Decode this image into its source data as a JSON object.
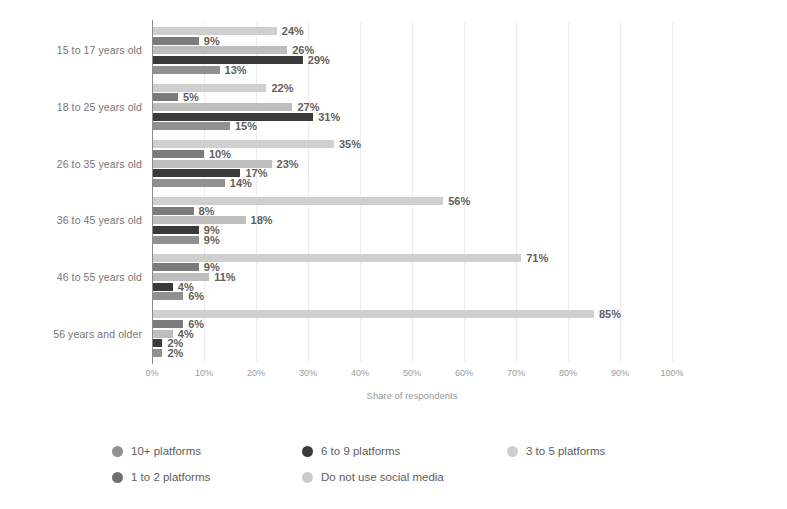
{
  "chart_data": {
    "type": "bar",
    "orientation": "horizontal",
    "grouped": true,
    "title": "",
    "xlabel": "Share of respondents",
    "ylabel": "",
    "xlim": [
      0,
      100
    ],
    "grid": true,
    "legend_position": "bottom",
    "xticks": [
      "0%",
      "10%",
      "20%",
      "30%",
      "40%",
      "50%",
      "60%",
      "70%",
      "80%",
      "90%",
      "100%"
    ],
    "xtick_values": [
      0,
      10,
      20,
      30,
      40,
      50,
      60,
      70,
      80,
      90,
      100
    ],
    "categories": [
      "15 to 17 years old",
      "18 to 25 years old",
      "26 to 35 years old",
      "36 to 45 years old",
      "46 to 55 years old",
      "56 years and older"
    ],
    "series": [
      {
        "name": "Do not use social media",
        "color": "#cfcfcf",
        "values": [
          24,
          22,
          35,
          56,
          71,
          85
        ],
        "labels": [
          "24%",
          "22%",
          "35%",
          "56%",
          "71%",
          "85%"
        ]
      },
      {
        "name": "1 to 2 platforms",
        "color": "#7b7b7b",
        "values": [
          9,
          5,
          10,
          8,
          9,
          6
        ],
        "labels": [
          "9%",
          "5%",
          "10%",
          "8%",
          "9%",
          "6%"
        ]
      },
      {
        "name": "3 to 5 platforms",
        "color": "#bdbdbd",
        "values": [
          26,
          27,
          23,
          18,
          11,
          4
        ],
        "labels": [
          "26%",
          "27%",
          "23%",
          "18%",
          "11%",
          "4%"
        ]
      },
      {
        "name": "6 to 9 platforms",
        "color": "#3a3a3a",
        "values": [
          29,
          31,
          17,
          9,
          4,
          2
        ],
        "labels": [
          "29%",
          "31%",
          "17%",
          "9%",
          "4%",
          "2%"
        ]
      },
      {
        "name": "10+ platforms",
        "color": "#909090",
        "values": [
          13,
          15,
          14,
          9,
          6,
          2
        ],
        "labels": [
          "13%",
          "15%",
          "14%",
          "9%",
          "6%",
          "2%"
        ]
      }
    ],
    "legend_entries": [
      {
        "label": "10+ platforms",
        "color": "#909090"
      },
      {
        "label": "6 to 9 platforms",
        "color": "#3a3a3a"
      },
      {
        "label": "3 to 5 platforms",
        "color": "#cfcfcf"
      },
      {
        "label": "1 to 2 platforms",
        "color": "#6f6f6f"
      },
      {
        "label": "Do not use social media",
        "color": "#cccccc"
      }
    ]
  }
}
